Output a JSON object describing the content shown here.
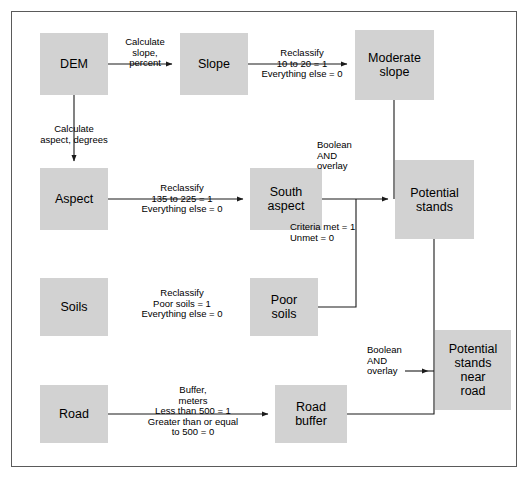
{
  "diagram": {
    "frame": {
      "border_color": "#5a5a5a",
      "background": "#ffffff"
    },
    "node_fill": "#d2d2d2",
    "line_color": "#1a1a1a",
    "nodes": [
      {
        "id": "dem",
        "label": "DEM",
        "x": 40,
        "y": 33,
        "w": 68,
        "h": 62
      },
      {
        "id": "slope",
        "label": "Slope",
        "x": 180,
        "y": 33,
        "w": 68,
        "h": 62
      },
      {
        "id": "moderate_slope",
        "label": "Moderate\nslope",
        "x": 355,
        "y": 30,
        "w": 79,
        "h": 70
      },
      {
        "id": "aspect",
        "label": "Aspect",
        "x": 40,
        "y": 168,
        "w": 68,
        "h": 62
      },
      {
        "id": "south_aspect",
        "label": "South\naspect",
        "x": 250,
        "y": 168,
        "w": 72,
        "h": 62
      },
      {
        "id": "potential",
        "label": "Potential\nstands",
        "x": 395,
        "y": 160,
        "w": 79,
        "h": 79
      },
      {
        "id": "soils",
        "label": "Soils",
        "x": 40,
        "y": 278,
        "w": 68,
        "h": 58
      },
      {
        "id": "poor_soils",
        "label": "Poor\nsoils",
        "x": 250,
        "y": 278,
        "w": 68,
        "h": 58
      },
      {
        "id": "road",
        "label": "Road",
        "x": 40,
        "y": 385,
        "w": 68,
        "h": 58
      },
      {
        "id": "road_buffer",
        "label": "Road\nbuffer",
        "x": 275,
        "y": 385,
        "w": 72,
        "h": 58
      },
      {
        "id": "near_road",
        "label": "Potential\nstands\nnear\nroad",
        "x": 435,
        "y": 330,
        "w": 76,
        "h": 80
      }
    ],
    "edge_labels": [
      {
        "id": "calc-slope",
        "text": "Calculate\nslope,\npercent",
        "x": 112,
        "y": 37,
        "w": 66,
        "align": "center"
      },
      {
        "id": "calc-aspect",
        "text": "Calculate\naspect, degrees",
        "x": 22,
        "y": 124,
        "w": 104,
        "align": "center"
      },
      {
        "id": "reclass-slope",
        "text": "Reclassify\n10 to 20 = 1\nEverything else = 0",
        "x": 251,
        "y": 48,
        "w": 102,
        "align": "center"
      },
      {
        "id": "reclass-aspect",
        "text": "Reclassify\n135 to 225 = 1\nEverything else = 0",
        "x": 119,
        "y": 183,
        "w": 126,
        "align": "center"
      },
      {
        "id": "boolean-and-1",
        "text": "Boolean\nAND\noverlay",
        "x": 317,
        "y": 140,
        "w": 56,
        "align": "left"
      },
      {
        "id": "criteria-met",
        "text": "Criteria met = 1\nUnmet = 0",
        "x": 290,
        "y": 222,
        "w": 86,
        "align": "left"
      },
      {
        "id": "reclass-soils",
        "text": "Reclassify\nPoor soils = 1\nEverything else = 0",
        "x": 119,
        "y": 288,
        "w": 126,
        "align": "center"
      },
      {
        "id": "buffer-road",
        "text": "Buffer,\nmeters\nLess than 500 = 1\nGreater than or equal\nto 500 = 0",
        "x": 118,
        "y": 385,
        "w": 150,
        "align": "center"
      },
      {
        "id": "boolean-and-2",
        "text": "Boolean\nAND\noverlay",
        "x": 367,
        "y": 345,
        "w": 56,
        "align": "left"
      }
    ]
  }
}
